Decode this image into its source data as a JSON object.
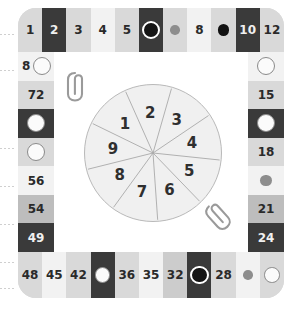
{
  "board": {
    "title": "multiplication-spinner-board",
    "colors": {
      "board_bg": "#d8d8d8",
      "inner_bg": "#ffffff",
      "dark_cell": "#3a3a3a",
      "light_cell": "#f2f2f2",
      "mid_cell": "#d9d9d9",
      "gray_cell": "#bdbdbd",
      "marker_white": "#fbfbfb",
      "marker_black": "#151515",
      "marker_gray": "#8d8d8d",
      "text": "#2a2a2a"
    },
    "top_row": [
      {
        "label": "1",
        "tone": "t-mid",
        "marker": "none"
      },
      {
        "label": "2",
        "tone": "t-dark",
        "marker": "none"
      },
      {
        "label": "3",
        "tone": "t-mid",
        "marker": "none"
      },
      {
        "label": "4",
        "tone": "t-light",
        "marker": "none"
      },
      {
        "label": "5",
        "tone": "t-mid",
        "marker": "none"
      },
      {
        "label": "",
        "tone": "t-dark",
        "marker": "black-ring"
      },
      {
        "label": "",
        "tone": "t-mid",
        "marker": "gray"
      },
      {
        "label": "8",
        "tone": "t-light",
        "marker": "none"
      },
      {
        "label": "",
        "tone": "t-mid",
        "marker": "black-plain"
      },
      {
        "label": "10",
        "tone": "t-dark",
        "marker": "none"
      },
      {
        "label": "12",
        "tone": "t-mid",
        "marker": "none"
      }
    ],
    "right_col": [
      {
        "label": "",
        "tone": "t-light",
        "marker": "white"
      },
      {
        "label": "15",
        "tone": "t-mid",
        "marker": "none"
      },
      {
        "label": "",
        "tone": "t-dark",
        "marker": "white"
      },
      {
        "label": "18",
        "tone": "t-mid",
        "marker": "none"
      },
      {
        "label": "",
        "tone": "t-light",
        "marker": "gray"
      },
      {
        "label": "21",
        "tone": "t-gray",
        "marker": "none"
      },
      {
        "label": "24",
        "tone": "t-dark",
        "marker": "none"
      }
    ],
    "bottom_row": [
      {
        "label": "48",
        "tone": "t-mid",
        "marker": "none"
      },
      {
        "label": "45",
        "tone": "t-light",
        "marker": "none"
      },
      {
        "label": "42",
        "tone": "t-mid",
        "marker": "none"
      },
      {
        "label": "",
        "tone": "t-dark",
        "marker": "white"
      },
      {
        "label": "36",
        "tone": "t-mid",
        "marker": "none"
      },
      {
        "label": "35",
        "tone": "t-light",
        "marker": "none"
      },
      {
        "label": "32",
        "tone": "t-mid2",
        "marker": "none"
      },
      {
        "label": "",
        "tone": "t-dark",
        "marker": "black-ring"
      },
      {
        "label": "28",
        "tone": "t-mid",
        "marker": "none"
      },
      {
        "label": "",
        "tone": "t-light",
        "marker": "gray"
      },
      {
        "label": "",
        "tone": "t-mid",
        "marker": "white"
      }
    ],
    "left_col": [
      {
        "label": "8",
        "tone": "t-light",
        "marker": "white"
      },
      {
        "label": "72",
        "tone": "t-mid",
        "marker": "none"
      },
      {
        "label": "",
        "tone": "t-dark",
        "marker": "white"
      },
      {
        "label": "",
        "tone": "t-mid",
        "marker": "white"
      },
      {
        "label": "56",
        "tone": "t-light",
        "marker": "none"
      },
      {
        "label": "54",
        "tone": "t-gray",
        "marker": "none"
      },
      {
        "label": "49",
        "tone": "t-dark",
        "marker": "none"
      }
    ]
  },
  "spinner": {
    "name": "nine-sector-spinner",
    "sector_count": 9,
    "sectors": [
      "1",
      "2",
      "3",
      "4",
      "5",
      "6",
      "7",
      "8",
      "9"
    ]
  },
  "paperclips": [
    {
      "name": "paperclip-upper-left",
      "orientation": "vertical"
    },
    {
      "name": "paperclip-lower-right",
      "orientation": "diagonal"
    }
  ]
}
